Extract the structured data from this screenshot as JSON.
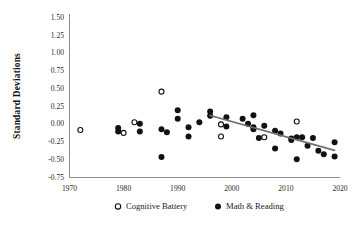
{
  "chart_data": {
    "type": "scatter",
    "title": "",
    "xlabel": "",
    "ylabel": "Standard Deviations",
    "xlim": [
      1970,
      2020
    ],
    "ylim": [
      -0.75,
      1.5
    ],
    "xticks": [
      "1970",
      "1980",
      "1990",
      "2000",
      "2010",
      "2020"
    ],
    "xtick_values": [
      1970,
      1980,
      1990,
      2000,
      2010,
      2020
    ],
    "yticks": [
      "1.50",
      "1.25",
      "1.00",
      "0.75",
      "0.50",
      "0.25",
      "0.00",
      "-0.25",
      "-0.50",
      "-0.75"
    ],
    "ytick_values": [
      1.5,
      1.25,
      1.0,
      0.75,
      0.5,
      0.25,
      0.0,
      -0.25,
      -0.5,
      -0.75
    ],
    "grid": false,
    "legend_position": "bottom",
    "series": [
      {
        "name": "Cognitive Battery",
        "marker": "open-circle",
        "color": "#111111",
        "points": [
          [
            1972,
            -0.09
          ],
          [
            1980,
            -0.13
          ],
          [
            1982,
            0.02
          ],
          [
            1987,
            0.45
          ],
          [
            1998,
            -0.01
          ],
          [
            1998,
            -0.18
          ],
          [
            2006,
            -0.19
          ],
          [
            2012,
            0.03
          ]
        ]
      },
      {
        "name": "Math & Reading",
        "marker": "filled-circle",
        "color": "#111111",
        "points": [
          [
            1979,
            -0.06
          ],
          [
            1979,
            -0.11
          ],
          [
            1983,
            0.0
          ],
          [
            1983,
            -0.11
          ],
          [
            1987,
            -0.08
          ],
          [
            1987,
            -0.47
          ],
          [
            1988,
            -0.12
          ],
          [
            1990,
            0.19
          ],
          [
            1990,
            0.07
          ],
          [
            1992,
            -0.05
          ],
          [
            1992,
            -0.18
          ],
          [
            1994,
            0.02
          ],
          [
            1996,
            0.17
          ],
          [
            1996,
            0.11
          ],
          [
            1999,
            0.09
          ],
          [
            1999,
            -0.04
          ],
          [
            2002,
            0.07
          ],
          [
            2003,
            0.0
          ],
          [
            2004,
            0.12
          ],
          [
            2004,
            -0.05
          ],
          [
            2004,
            -0.08
          ],
          [
            2005,
            -0.2
          ],
          [
            2006,
            -0.03
          ],
          [
            2008,
            -0.1
          ],
          [
            2008,
            -0.35
          ],
          [
            2009,
            -0.14
          ],
          [
            2011,
            -0.21
          ],
          [
            2011,
            -0.23
          ],
          [
            2012,
            -0.5
          ],
          [
            2012,
            -0.19
          ],
          [
            2013,
            -0.19
          ],
          [
            2014,
            -0.31
          ],
          [
            2015,
            -0.2
          ],
          [
            2016,
            -0.38
          ],
          [
            2017,
            -0.43
          ],
          [
            2019,
            -0.26
          ],
          [
            2019,
            -0.46
          ]
        ]
      }
    ],
    "trendline": {
      "name": "linear-trend",
      "color": "#6e6e6e",
      "x_start": 1996,
      "y_start": 0.115,
      "x_end": 2019,
      "y_end": -0.375
    }
  },
  "legend": {
    "items": [
      {
        "label": "Cognitive Battery",
        "marker": "open-circle"
      },
      {
        "label": "Math & Reading",
        "marker": "filled-circle"
      }
    ]
  }
}
